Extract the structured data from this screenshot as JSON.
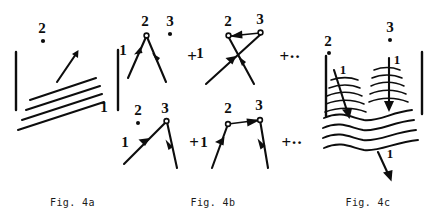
{
  "document": {
    "type": "scientific-figure-group",
    "background_color": "#ffffff",
    "ink_color": "#0d0d0d",
    "width": 436,
    "height": 216
  },
  "panels": [
    {
      "id": "fig-4a",
      "caption": "Fig. 4a",
      "description": "Two vertical barrier bars with a set of four parallel diagonal wavefront lines between them; an upward-right arrow labeled 1 crosses toward vertex 2.",
      "vertex_labels": [
        {
          "name": "2",
          "marker": "filled-dot"
        }
      ],
      "line_labels": [
        {
          "name": "1",
          "position": "lower-right-of-wavefronts"
        }
      ],
      "bars": 2,
      "wavefront_lines": 4,
      "arrows": 1
    },
    {
      "id": "fig-4b",
      "caption": "Fig. 4b",
      "description": "Four Feynman-like scattering diagrams arranged in two rows of two, joined by plus signs, each row terminated by an ellipsis.",
      "operators": {
        "plus": "+",
        "ellipsis": "+··"
      },
      "diagrams": [
        {
          "id": "4b-d1",
          "row": "top",
          "shape": "lambda",
          "apex_label": "2",
          "apex_marker": "open-circle",
          "spectator_label": "3",
          "spectator_marker": "filled-dot",
          "incoming_label": "1",
          "arrows": 2
        },
        {
          "id": "4b-d2",
          "row": "top",
          "shape": "crossed-x",
          "left_vertex_label": "2",
          "left_vertex_marker": "open-circle",
          "right_vertex_label": "3",
          "right_vertex_marker": "open-circle",
          "exchange_arrow": "3-to-2",
          "incoming_label": "1",
          "arrows": 3
        },
        {
          "id": "4b-d3",
          "row": "bottom",
          "shape": "lambda",
          "apex_label": "3",
          "apex_marker": "open-circle",
          "spectator_label": "2",
          "spectator_marker": "filled-dot",
          "incoming_label": "1",
          "arrows": 2
        },
        {
          "id": "4b-d4",
          "row": "bottom",
          "shape": "trapezoid",
          "left_vertex_label": "2",
          "left_vertex_marker": "open-circle",
          "right_vertex_label": "3",
          "right_vertex_marker": "open-circle",
          "exchange_arrow": "2-to-3",
          "incoming_label": "1",
          "arrows": 3
        }
      ]
    },
    {
      "id": "fig-4c",
      "caption": "Fig. 4c",
      "description": "Two vertical barrier bars enclosing families of curved wavefronts; two arrows labeled 1 enter from above toward vertices 2 and 3, and one arrow labeled 1 exits below.",
      "vertex_labels": [
        {
          "name": "2",
          "marker": "filled-dot"
        },
        {
          "name": "3",
          "marker": "filled-dot"
        }
      ],
      "line_labels": [
        {
          "name": "1",
          "position": "left-incoming-arrow"
        },
        {
          "name": "1",
          "position": "right-incoming-arrow"
        },
        {
          "name": "1",
          "position": "bottom-outgoing-arrow"
        }
      ],
      "bars": 2,
      "wavefront_groups": 3,
      "arrows": 3
    }
  ]
}
